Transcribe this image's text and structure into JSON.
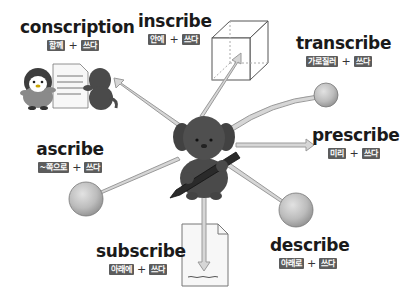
{
  "diagram": {
    "center": {
      "label": "dog holding pen",
      "icon": "dog-with-pen-icon"
    },
    "terms": [
      {
        "id": "conscription",
        "word": "conscription",
        "prefix_meaning": "함께",
        "root_meaning": "쓰다",
        "plus": "+",
        "illustration": "penguin-and-dog-writing-document"
      },
      {
        "id": "inscribe",
        "word": "inscribe",
        "prefix_meaning": "안에",
        "root_meaning": "쓰다",
        "plus": "+",
        "illustration": "arrow-into-cube"
      },
      {
        "id": "transcribe",
        "word": "transcribe",
        "prefix_meaning": "가로질러",
        "root_meaning": "쓰다",
        "plus": "+",
        "illustration": "curved-arrow-to-ball"
      },
      {
        "id": "prescribe",
        "word": "prescribe",
        "prefix_meaning": "미리",
        "root_meaning": "쓰다",
        "plus": "+",
        "illustration": "arrow-forward"
      },
      {
        "id": "ascribe",
        "word": "ascribe",
        "prefix_meaning": "~쪽으로",
        "root_meaning": "쓰다",
        "plus": "+",
        "illustration": "arrow-to-ball"
      },
      {
        "id": "subscribe",
        "word": "subscribe",
        "prefix_meaning": "아래에",
        "root_meaning": "쓰다",
        "plus": "+",
        "illustration": "arrow-down-to-document-bottom"
      },
      {
        "id": "describe",
        "word": "describe",
        "prefix_meaning": "아래로",
        "root_meaning": "쓰다",
        "plus": "+",
        "illustration": "arrow-down-to-ball"
      }
    ],
    "colors": {
      "badge_bg": "#5c5c5c",
      "badge_text": "#ffffff",
      "word_text": "#1a1a1a",
      "arrow_fill": "#d4d4d4",
      "arrow_stroke": "#9a9a9a",
      "ball_fill": "#bdbdbd",
      "dog_fill": "#4a4a4a"
    }
  }
}
